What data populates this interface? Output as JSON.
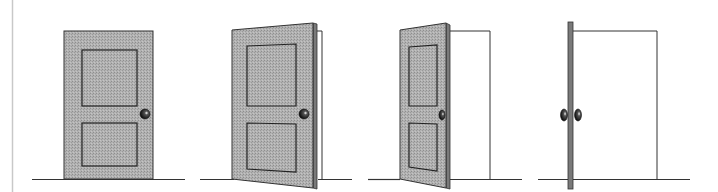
{
  "diagram": {
    "colors": {
      "background": "#ffffff",
      "door_fill": "#a9a9a9",
      "door_edge": "#7a7a7a",
      "outline": "#333333",
      "knob": "#1a1a1a",
      "margin_line": "#c8c8c8"
    },
    "frames": [
      {
        "id": "closed",
        "state": "closed"
      },
      {
        "id": "slightly-open",
        "state": "slightly open"
      },
      {
        "id": "half-open",
        "state": "half open"
      },
      {
        "id": "fully-open",
        "state": "fully open (edge view)"
      }
    ]
  }
}
